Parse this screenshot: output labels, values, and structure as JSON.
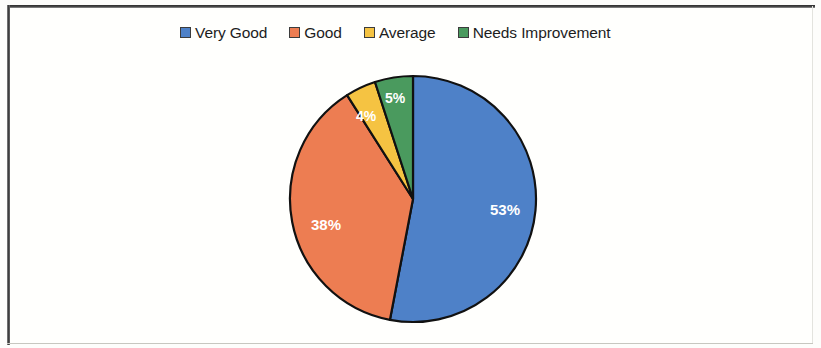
{
  "frame": {
    "border_color": "#3a3a3a",
    "page_background": "#fffffd"
  },
  "legend": {
    "position": "top",
    "items": [
      {
        "label": "Very Good",
        "color": "#4E81C8",
        "marker": "square-swatch-icon"
      },
      {
        "label": "Good",
        "color": "#ED7D52",
        "marker": "square-swatch-icon"
      },
      {
        "label": "Average",
        "color": "#F5C342",
        "marker": "square-swatch-icon"
      },
      {
        "label": "Needs Improvement",
        "color": "#4A9A5E",
        "marker": "square-swatch-icon"
      }
    ]
  },
  "chart_data": {
    "type": "pie",
    "title": "",
    "subtitle": "",
    "xlabel": "",
    "ylabel": "",
    "grid": false,
    "legend_position": "top",
    "start_angle_deg": 0,
    "direction": "clockwise",
    "categories": [
      "Very Good",
      "Good",
      "Average",
      "Needs Improvement"
    ],
    "values": [
      53,
      38,
      4,
      5
    ],
    "value_unit": "%",
    "colors": [
      "#4E81C8",
      "#ED7D52",
      "#F5C342",
      "#4A9A5E"
    ],
    "slice_outline_color": "#111111",
    "data_label_color": "#ffffff",
    "data_labels": [
      "53%",
      "38%",
      "4%",
      "5%"
    ],
    "center": {
      "x": 413,
      "y": 199
    },
    "radius": 123,
    "label_positions": [
      {
        "x": 505,
        "y": 211
      },
      {
        "x": 326,
        "y": 226
      },
      {
        "x": 366,
        "y": 117
      },
      {
        "x": 395,
        "y": 99
      }
    ]
  }
}
